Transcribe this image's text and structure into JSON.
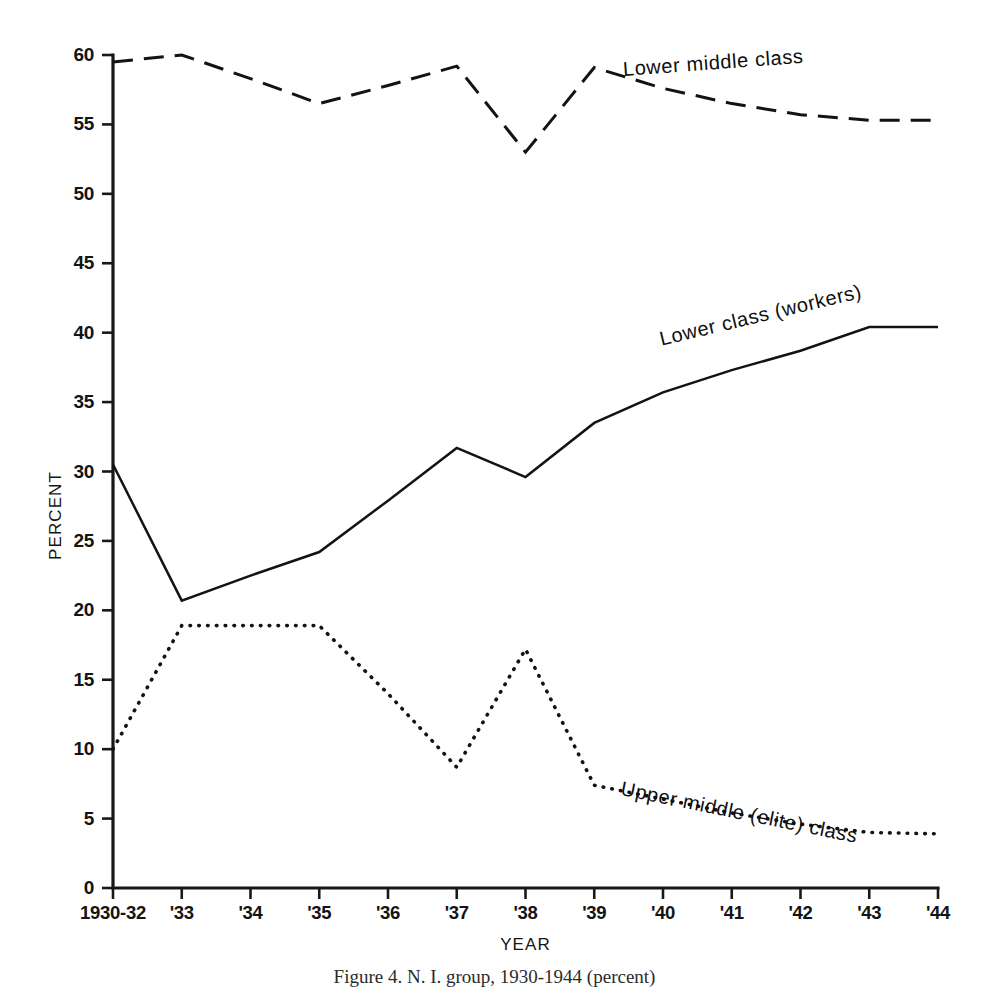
{
  "figure": {
    "caption": "Figure 4.   N. I. group, 1930-1944 (percent)"
  },
  "axes": {
    "y_title": "PERCENT",
    "x_title": "YEAR",
    "y_ticks": [
      "0",
      "5",
      "10",
      "15",
      "20",
      "25",
      "30",
      "35",
      "40",
      "45",
      "50",
      "55",
      "60"
    ],
    "x_ticks": [
      "1930-32",
      "'33",
      "'34",
      "'35",
      "'36",
      "'37",
      "'38",
      "'39",
      "'40",
      "'41",
      "'42",
      "'43",
      "'44"
    ]
  },
  "series_labels": {
    "lower_middle": "Lower middle class",
    "lower_workers": "Lower class (workers)",
    "upper_middle": "Upper middle (elite) class"
  },
  "chart_data": {
    "type": "line",
    "title": "",
    "xlabel": "YEAR",
    "ylabel": "PERCENT",
    "xlim": [
      0,
      12
    ],
    "ylim": [
      0,
      60
    ],
    "grid": false,
    "legend_position": "inline-annotations",
    "categories": [
      "1930-32",
      "'33",
      "'34",
      "'35",
      "'36",
      "'37",
      "'38",
      "'39",
      "'40",
      "'41",
      "'42",
      "'43",
      "'44"
    ],
    "series": [
      {
        "name": "Lower middle class",
        "style": "dashed",
        "values": [
          59.5,
          60.0,
          58.3,
          56.5,
          57.8,
          59.2,
          53.0,
          59.1,
          57.6,
          56.5,
          55.7,
          55.3,
          55.3
        ]
      },
      {
        "name": "Lower class (workers)",
        "style": "solid",
        "values": [
          30.5,
          20.7,
          22.5,
          24.2,
          27.9,
          31.7,
          29.6,
          33.5,
          35.7,
          37.3,
          38.7,
          40.4,
          40.4
        ]
      },
      {
        "name": "Upper middle (elite) class",
        "style": "dotted",
        "values": [
          10.0,
          18.9,
          18.9,
          18.9,
          14.0,
          8.7,
          17.2,
          7.4,
          6.4,
          5.4,
          4.6,
          4.0,
          3.9
        ]
      }
    ]
  }
}
